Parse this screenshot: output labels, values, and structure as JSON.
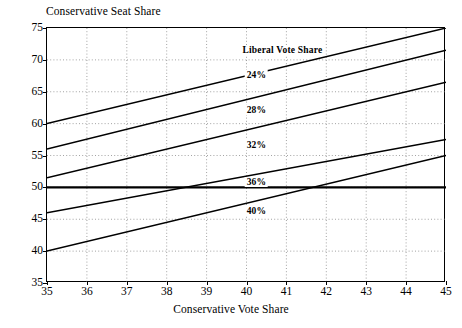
{
  "chart_data": {
    "type": "line",
    "title": "",
    "xlabel": "Conservative Vote Share",
    "ylabel": "Conservative Seat Share",
    "xlim": [
      35,
      45
    ],
    "ylim": [
      35,
      75
    ],
    "xticks": [
      35,
      36,
      37,
      38,
      39,
      40,
      41,
      42,
      43,
      44,
      45
    ],
    "yticks": [
      35,
      40,
      45,
      50,
      55,
      60,
      65,
      70,
      75
    ],
    "grid": true,
    "legend_title": "Liberal Vote Share",
    "legend_position": "inside-upper-right",
    "x": [
      35,
      45
    ],
    "series": [
      {
        "name": "24%",
        "label": "24%",
        "values": [
          60.0,
          75.0
        ]
      },
      {
        "name": "28%",
        "label": "28%",
        "values": [
          56.0,
          71.5
        ]
      },
      {
        "name": "32%",
        "label": "32%",
        "values": [
          51.5,
          66.5
        ]
      },
      {
        "name": "36%",
        "label": "36%",
        "values": [
          46.0,
          57.5
        ]
      },
      {
        "name": "40%",
        "label": "40%",
        "values": [
          40.0,
          55.0
        ]
      }
    ],
    "reference_line": {
      "name": "majority-threshold",
      "y": 50,
      "label": ""
    },
    "line_color": "#000000",
    "grid_color": "#8c8c8c",
    "frame_color": "#000000"
  },
  "axes": {
    "y_title": "Conservative Seat Share",
    "x_title": "Conservative Vote Share",
    "y_tick_labels": [
      "35",
      "40",
      "45",
      "50",
      "55",
      "60",
      "65",
      "70",
      "75"
    ],
    "x_tick_labels": [
      "35",
      "36",
      "37",
      "38",
      "39",
      "40",
      "41",
      "42",
      "43",
      "44",
      "45"
    ]
  },
  "legend": {
    "title": "Liberal Vote Share",
    "entries": [
      "24%",
      "28%",
      "32%",
      "36%",
      "40%"
    ]
  }
}
